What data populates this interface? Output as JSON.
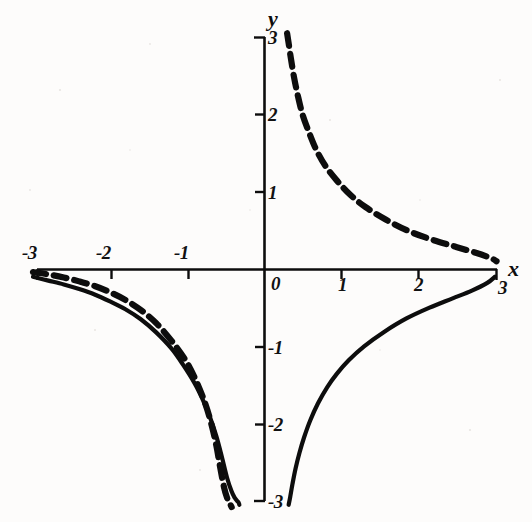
{
  "figure": {
    "background_color": "#fdfcfb",
    "ink_color": "#0d0d0d",
    "axes": {
      "x_axis_label": "x",
      "y_axis_label": "y",
      "origin_label": "0"
    }
  },
  "chart_data": {
    "type": "line",
    "title": "",
    "subtitle": "",
    "xlabel": "x",
    "ylabel": "y",
    "xlim": [
      -3,
      3
    ],
    "ylim": [
      -3,
      3
    ],
    "grid": false,
    "legend": "none",
    "x_ticks": [
      -3,
      -2,
      -1,
      1,
      2,
      3
    ],
    "x_tick_labels": [
      "-3",
      "-2",
      "-1",
      "1",
      "2",
      "3"
    ],
    "y_ticks": [
      3,
      2,
      1,
      -1,
      -2,
      -3
    ],
    "y_tick_labels": [
      "3",
      "2",
      "1",
      "-1",
      "-2",
      "-3"
    ],
    "origin_label": "0",
    "axis_arrow": false,
    "series": [
      {
        "name": "solid-curve",
        "style": "solid",
        "linewidth": 4,
        "color": "#0d0d0d",
        "branches": [
          {
            "name": "left-branch",
            "x": [
              -3.0,
              -2.8,
              -2.6,
              -2.4,
              -2.2,
              -2.0,
              -1.8,
              -1.6,
              -1.4,
              -1.2,
              -1.05,
              -0.9,
              -0.8,
              -0.7,
              -0.62,
              -0.55,
              -0.48,
              -0.42,
              -0.38,
              -0.35,
              -0.33,
              -0.32
            ],
            "y": [
              -0.1,
              -0.15,
              -0.2,
              -0.26,
              -0.33,
              -0.42,
              -0.52,
              -0.65,
              -0.82,
              -1.03,
              -1.24,
              -1.48,
              -1.68,
              -1.92,
              -2.16,
              -2.42,
              -2.7,
              -2.88,
              -2.96,
              -3.0,
              -3.02,
              -3.05
            ]
          },
          {
            "name": "right-branch",
            "x": [
              0.32,
              0.34,
              0.37,
              0.41,
              0.46,
              0.52,
              0.6,
              0.7,
              0.82,
              0.95,
              1.1,
              1.3,
              1.55,
              1.85,
              2.15,
              2.45,
              2.7,
              2.9,
              3.0
            ],
            "y": [
              -3.05,
              -2.95,
              -2.78,
              -2.58,
              -2.38,
              -2.18,
              -1.96,
              -1.74,
              -1.53,
              -1.35,
              -1.18,
              -1.0,
              -0.82,
              -0.64,
              -0.5,
              -0.38,
              -0.28,
              -0.18,
              -0.1
            ]
          }
        ]
      },
      {
        "name": "dashed-curve",
        "style": "dashed",
        "linewidth": 6,
        "dash_length": 12,
        "gap_length": 7,
        "color": "#0d0d0d",
        "branches": [
          {
            "name": "upper-right-branch",
            "x": [
              0.3,
              0.32,
              0.35,
              0.39,
              0.44,
              0.5,
              0.58,
              0.68,
              0.8,
              0.95,
              1.12,
              1.32,
              1.58,
              1.88,
              2.18,
              2.48,
              2.75,
              2.95,
              3.02
            ],
            "y": [
              3.05,
              2.92,
              2.72,
              2.48,
              2.24,
              2.0,
              1.78,
              1.54,
              1.33,
              1.14,
              0.96,
              0.8,
              0.64,
              0.49,
              0.38,
              0.29,
              0.21,
              0.14,
              0.1
            ]
          },
          {
            "name": "lower-left-branch",
            "x": [
              -3.0,
              -2.8,
              -2.6,
              -2.4,
              -2.2,
              -2.0,
              -1.8,
              -1.6,
              -1.4,
              -1.2,
              -1.02,
              -0.88,
              -0.76,
              -0.68,
              -0.62,
              -0.57,
              -0.52,
              -0.48,
              -0.45,
              -0.43,
              -0.42
            ],
            "y": [
              -0.04,
              -0.07,
              -0.11,
              -0.16,
              -0.22,
              -0.3,
              -0.4,
              -0.53,
              -0.7,
              -0.93,
              -1.18,
              -1.45,
              -1.75,
              -2.02,
              -2.28,
              -2.56,
              -2.82,
              -2.96,
              -3.02,
              -3.06,
              -3.08
            ]
          }
        ]
      }
    ],
    "annotations": []
  },
  "geometry": {
    "origin_px": {
      "x": 264,
      "y": 269
    },
    "unit_px": {
      "x": 77,
      "y": 77.3
    },
    "tick_length_px": 9
  },
  "labels": {
    "x_axis": "x",
    "y_axis": "y",
    "origin": "0",
    "x_neg3": "-3",
    "x_neg2": "-2",
    "x_neg1": "-1",
    "x_pos1": "1",
    "x_pos2": "2",
    "x_pos3": "3",
    "y_pos3": "3",
    "y_pos2": "2",
    "y_pos1": "1",
    "y_neg1": "-1",
    "y_neg2": "-2",
    "y_neg3": "-3"
  }
}
